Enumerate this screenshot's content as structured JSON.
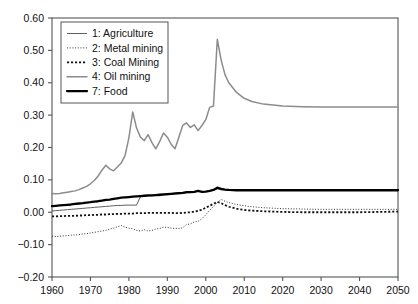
{
  "chart_data": {
    "type": "line",
    "title": "",
    "xlabel": "",
    "ylabel": "",
    "xlim": [
      1960,
      2050
    ],
    "ylim": [
      -0.2,
      0.6
    ],
    "xticks": [
      1960,
      1970,
      1980,
      1990,
      2000,
      2010,
      2020,
      2030,
      2040,
      2050
    ],
    "yticks": [
      -0.2,
      -0.1,
      0.0,
      0.1,
      0.2,
      0.3,
      0.4,
      0.5,
      0.6
    ],
    "xtick_labels": [
      "1960",
      "1970",
      "1980",
      "1990",
      "2000",
      "2010",
      "2020",
      "2030",
      "2040",
      "2050"
    ],
    "ytick_labels": [
      "-0.20",
      "-0.10",
      "0.00",
      "0.10",
      "0.20",
      "0.30",
      "0.40",
      "0.50",
      "0.60"
    ],
    "grid": false,
    "legend_position": "upper-left-inside",
    "legend_entries": [
      {
        "key": "1",
        "label": "1: Agriculture",
        "style": "solid-thin",
        "color": "#4d4d4d"
      },
      {
        "key": "2",
        "label": "2: Metal mining",
        "style": "dotted-fine",
        "color": "#333333"
      },
      {
        "key": "3",
        "label": "3: Coal Mining",
        "style": "dotted-coarse",
        "color": "#111111"
      },
      {
        "key": "4",
        "label": "4: Oil mining",
        "style": "solid-medium",
        "color": "#8c8c8c"
      },
      {
        "key": "7",
        "label": "7: Food",
        "style": "solid-thick",
        "color": "#000000"
      }
    ],
    "x": [
      1960,
      1961,
      1962,
      1963,
      1964,
      1965,
      1966,
      1967,
      1968,
      1969,
      1970,
      1971,
      1972,
      1973,
      1974,
      1975,
      1976,
      1977,
      1978,
      1979,
      1980,
      1981,
      1982,
      1983,
      1984,
      1985,
      1986,
      1987,
      1988,
      1989,
      1990,
      1991,
      1992,
      1993,
      1994,
      1995,
      1996,
      1997,
      1998,
      1999,
      2000,
      2001,
      2002,
      2003,
      2004,
      2005,
      2006,
      2008,
      2010,
      2012,
      2015,
      2020,
      2025,
      2030,
      2035,
      2040,
      2045,
      2050
    ],
    "series": [
      {
        "name": "1: Agriculture",
        "values": [
          0.004,
          0.005,
          0.006,
          0.007,
          0.008,
          0.009,
          0.01,
          0.011,
          0.012,
          0.013,
          0.014,
          0.015,
          0.016,
          0.017,
          0.018,
          0.019,
          0.02,
          0.021,
          0.021,
          0.022,
          0.022,
          0.022,
          0.022,
          0.048,
          0.049,
          0.05,
          0.051,
          0.052,
          0.051,
          0.053,
          0.054,
          0.055,
          0.056,
          0.057,
          0.058,
          0.06,
          0.061,
          0.062,
          0.066,
          0.063,
          0.064,
          0.066,
          0.068,
          0.072,
          0.069,
          0.07,
          0.07,
          0.07,
          0.07,
          0.07,
          0.07,
          0.07,
          0.07,
          0.07,
          0.07,
          0.07,
          0.07,
          0.07
        ]
      },
      {
        "name": "2: Metal mining",
        "values": [
          -0.074,
          -0.075,
          -0.074,
          -0.073,
          -0.072,
          -0.071,
          -0.07,
          -0.069,
          -0.067,
          -0.066,
          -0.064,
          -0.062,
          -0.06,
          -0.058,
          -0.056,
          -0.052,
          -0.049,
          -0.045,
          -0.041,
          -0.046,
          -0.049,
          -0.051,
          -0.056,
          -0.058,
          -0.054,
          -0.058,
          -0.056,
          -0.052,
          -0.05,
          -0.046,
          -0.047,
          -0.049,
          -0.05,
          -0.05,
          -0.048,
          -0.038,
          -0.036,
          -0.03,
          -0.028,
          -0.02,
          -0.008,
          0.006,
          0.018,
          0.03,
          0.04,
          0.034,
          0.03,
          0.024,
          0.02,
          0.017,
          0.014,
          0.011,
          0.01,
          0.009,
          0.009,
          0.009,
          0.009,
          0.009
        ]
      },
      {
        "name": "3: Coal Mining",
        "values": [
          -0.013,
          -0.013,
          -0.012,
          -0.012,
          -0.011,
          -0.011,
          -0.011,
          -0.01,
          -0.01,
          -0.009,
          -0.009,
          -0.008,
          -0.008,
          -0.007,
          -0.007,
          -0.006,
          -0.006,
          -0.005,
          -0.005,
          -0.004,
          -0.004,
          -0.004,
          -0.003,
          -0.003,
          -0.003,
          -0.002,
          -0.002,
          -0.002,
          -0.002,
          -0.002,
          -0.002,
          -0.002,
          -0.003,
          -0.003,
          -0.002,
          -0.001,
          0.0,
          0.002,
          0.004,
          0.008,
          0.014,
          0.02,
          0.026,
          0.032,
          0.028,
          0.022,
          0.017,
          0.011,
          0.007,
          0.005,
          0.003,
          0.001,
          0.0,
          0.0,
          0.0,
          0.0,
          0.001,
          0.002
        ]
      },
      {
        "name": "4: Oil mining",
        "values": [
          0.058,
          0.057,
          0.058,
          0.06,
          0.062,
          0.064,
          0.066,
          0.07,
          0.075,
          0.08,
          0.088,
          0.098,
          0.112,
          0.13,
          0.145,
          0.134,
          0.128,
          0.14,
          0.152,
          0.175,
          0.23,
          0.31,
          0.26,
          0.232,
          0.221,
          0.24,
          0.215,
          0.196,
          0.218,
          0.245,
          0.232,
          0.21,
          0.196,
          0.232,
          0.268,
          0.276,
          0.262,
          0.27,
          0.252,
          0.268,
          0.286,
          0.324,
          0.328,
          0.534,
          0.47,
          0.425,
          0.4,
          0.37,
          0.352,
          0.342,
          0.334,
          0.328,
          0.326,
          0.325,
          0.325,
          0.325,
          0.325,
          0.325
        ]
      },
      {
        "name": "7: Food",
        "values": [
          0.019,
          0.02,
          0.021,
          0.022,
          0.023,
          0.024,
          0.026,
          0.027,
          0.028,
          0.03,
          0.031,
          0.033,
          0.034,
          0.036,
          0.038,
          0.039,
          0.041,
          0.043,
          0.045,
          0.046,
          0.047,
          0.048,
          0.049,
          0.05,
          0.051,
          0.052,
          0.052,
          0.053,
          0.054,
          0.055,
          0.056,
          0.057,
          0.058,
          0.059,
          0.06,
          0.062,
          0.062,
          0.063,
          0.066,
          0.063,
          0.064,
          0.066,
          0.069,
          0.076,
          0.072,
          0.07,
          0.069,
          0.068,
          0.068,
          0.068,
          0.068,
          0.068,
          0.068,
          0.068,
          0.068,
          0.068,
          0.068,
          0.068
        ]
      }
    ]
  }
}
